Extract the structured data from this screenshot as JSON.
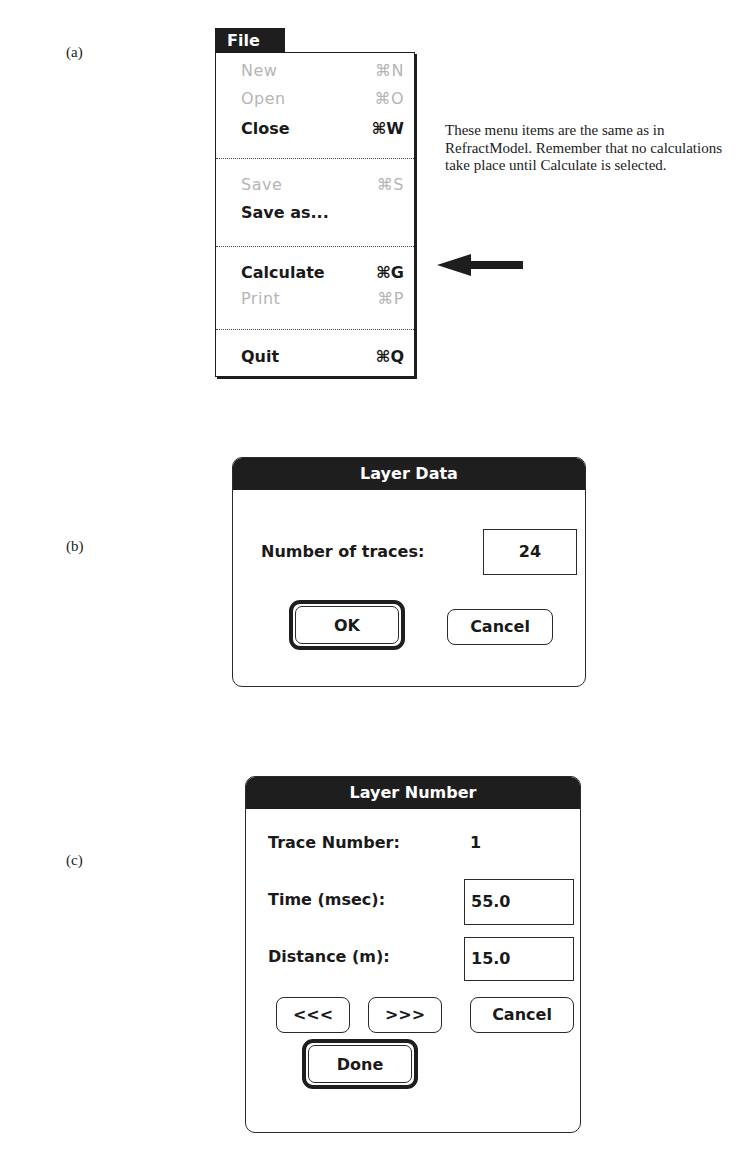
{
  "labels": {
    "a": "(a)",
    "b": "(b)",
    "c": "(c)"
  },
  "file_menu": {
    "title": "File",
    "items": [
      {
        "label": "New",
        "shortcut": "⌘N",
        "enabled": false
      },
      {
        "label": "Open",
        "shortcut": "⌘O",
        "enabled": false
      },
      {
        "label": "Close",
        "shortcut": "⌘W",
        "enabled": true
      },
      {
        "label": "Save",
        "shortcut": "⌘S",
        "enabled": false
      },
      {
        "label": "Save as...",
        "shortcut": "",
        "enabled": true
      },
      {
        "label": "Calculate",
        "shortcut": "⌘G",
        "enabled": true
      },
      {
        "label": "Print",
        "shortcut": "⌘P",
        "enabled": false
      },
      {
        "label": "Quit",
        "shortcut": "⌘Q",
        "enabled": true
      }
    ]
  },
  "annotation": {
    "text": "These menu items are the same as in RefractModel.  Remember that no calculations take place until Calculate is selected.",
    "arrow_target": "Calculate"
  },
  "layer_data_dialog": {
    "title": "Layer Data",
    "traces_label": "Number of traces:",
    "traces_value": "24",
    "ok_label": "OK",
    "cancel_label": "Cancel"
  },
  "layer_number_dialog": {
    "title": "Layer Number",
    "trace_number_label": "Trace Number:",
    "trace_number_value": "1",
    "time_label": "Time (msec):",
    "time_value": "55.0",
    "distance_label": "Distance (m):",
    "distance_value": "15.0",
    "prev_label": "<<<",
    "next_label": ">>>",
    "cancel_label": "Cancel",
    "done_label": "Done"
  }
}
